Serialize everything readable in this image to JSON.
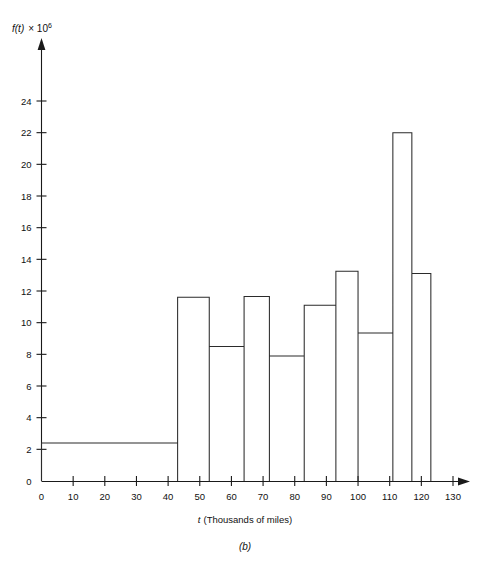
{
  "figure": {
    "caption": "(b)",
    "y_axis_label_fn": "f(t)",
    "y_axis_label_times": "× 10",
    "y_axis_label_exp": "6",
    "x_axis_label_var": "t",
    "x_axis_label_rest": "(Thousands of miles)"
  },
  "chart_data": {
    "type": "bar",
    "title": "",
    "subtitle": "",
    "xlabel": "t (Thousands of miles)",
    "ylabel": "f(t) × 10^6",
    "caption": "(b)",
    "grid": false,
    "legend": null,
    "xlim": [
      0,
      135
    ],
    "ylim": [
      0,
      25
    ],
    "xticks": [
      0,
      10,
      20,
      30,
      40,
      50,
      60,
      70,
      80,
      90,
      100,
      110,
      120,
      130
    ],
    "xticklabels": [
      "0",
      "10",
      "20",
      "30",
      "40",
      "50",
      "60",
      "70",
      "80",
      "90",
      "100",
      "110",
      "120",
      "130"
    ],
    "yticks": [
      0,
      2,
      4,
      6,
      8,
      10,
      12,
      14,
      16,
      18,
      20,
      22,
      24
    ],
    "yticklabels": [
      "0",
      "2",
      "4",
      "6",
      "8",
      "10",
      "12",
      "14",
      "16",
      "18",
      "20",
      "22",
      "24"
    ],
    "bin_edges": [
      0,
      43,
      53,
      64,
      72,
      83,
      93,
      100,
      111,
      117,
      123
    ],
    "values": [
      2.4,
      11.6,
      8.5,
      11.65,
      7.9,
      11.1,
      13.25,
      9.35,
      22.0,
      13.1
    ],
    "bars": [
      {
        "x0": 0,
        "x1": 43,
        "height": 2.4
      },
      {
        "x0": 43,
        "x1": 53,
        "height": 11.6
      },
      {
        "x0": 53,
        "x1": 64,
        "height": 8.5
      },
      {
        "x0": 64,
        "x1": 72,
        "height": 11.65
      },
      {
        "x0": 72,
        "x1": 83,
        "height": 7.9
      },
      {
        "x0": 83,
        "x1": 93,
        "height": 11.1
      },
      {
        "x0": 93,
        "x1": 100,
        "height": 13.25
      },
      {
        "x0": 100,
        "x1": 111,
        "height": 9.35
      },
      {
        "x0": 111,
        "x1": 117,
        "height": 22.0
      },
      {
        "x0": 117,
        "x1": 123,
        "height": 13.1
      }
    ]
  }
}
